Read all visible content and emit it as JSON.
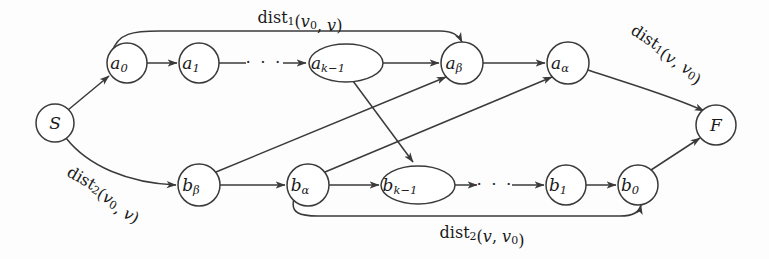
{
  "figure": {
    "background_color": "#fdfdfd",
    "stroke_color": "#3a3a3a",
    "text_color": "#1a1a1a",
    "width": 769,
    "height": 259
  },
  "nodes": [
    {
      "id": "S",
      "label_base": "S",
      "label_sub": "",
      "shape": "circle",
      "cx": 55,
      "cy": 123,
      "r": 19
    },
    {
      "id": "a0",
      "label_base": "a",
      "label_sub": "0",
      "shape": "circle",
      "cx": 127,
      "cy": 63,
      "r": 20
    },
    {
      "id": "a1",
      "label_base": "a",
      "label_sub": "1",
      "shape": "circle",
      "cx": 199,
      "cy": 63,
      "r": 20
    },
    {
      "id": "ak1",
      "label_base": "a",
      "label_sub": "k−1",
      "shape": "ellipse",
      "cx": 346,
      "cy": 63,
      "rx": 37,
      "ry": 19
    },
    {
      "id": "ab",
      "label_base": "a",
      "label_sub": "β",
      "shape": "circle",
      "cx": 462,
      "cy": 63,
      "r": 21
    },
    {
      "id": "aa",
      "label_base": "a",
      "label_sub": "α",
      "shape": "circle",
      "cx": 568,
      "cy": 63,
      "r": 21
    },
    {
      "id": "F",
      "label_base": "F",
      "label_sub": "",
      "shape": "circle",
      "cx": 716,
      "cy": 125,
      "r": 20
    },
    {
      "id": "bb",
      "label_base": "b",
      "label_sub": "β",
      "shape": "circle",
      "cx": 199,
      "cy": 185,
      "r": 21
    },
    {
      "id": "ba",
      "label_base": "b",
      "label_sub": "α",
      "shape": "circle",
      "cx": 308,
      "cy": 185,
      "r": 21
    },
    {
      "id": "bk1",
      "label_base": "b",
      "label_sub": "k−1",
      "shape": "ellipse",
      "cx": 418,
      "cy": 185,
      "rx": 37,
      "ry": 19
    },
    {
      "id": "b1",
      "label_base": "b",
      "label_sub": "1",
      "shape": "circle",
      "cx": 566,
      "cy": 185,
      "r": 20
    },
    {
      "id": "b0",
      "label_base": "b",
      "label_sub": "0",
      "shape": "circle",
      "cx": 638,
      "cy": 185,
      "r": 20
    }
  ],
  "ellipsis": [
    {
      "id": "top-ellipsis",
      "text": "· · ·",
      "x": 264,
      "y": 63
    },
    {
      "id": "bottom-ellipsis",
      "text": "· · ·",
      "x": 495,
      "y": 185
    }
  ],
  "edges": [
    {
      "id": "S-a0",
      "from": "S",
      "to": "a0",
      "d": "M 68 110 L 109 76",
      "arrow": true
    },
    {
      "id": "a0-a1",
      "from": "a0",
      "to": "a1",
      "d": "M 147 63 L 177 63",
      "arrow": true
    },
    {
      "id": "a1-dots",
      "from": "a1",
      "to": "dots",
      "d": "M 219 63 L 246 63",
      "arrow": false
    },
    {
      "id": "dots-ak1",
      "from": "dots",
      "to": "ak1",
      "d": "M 283 63 L 306 63",
      "arrow": true
    },
    {
      "id": "ak1-ab",
      "from": "ak1",
      "to": "ab",
      "d": "M 383 63 L 439 63",
      "arrow": true
    },
    {
      "id": "ab-aa",
      "from": "ab",
      "to": "aa",
      "d": "M 483 63 L 545 63",
      "arrow": true
    },
    {
      "id": "a0-ab-top",
      "from": "a0",
      "to": "ab",
      "d": "M 112 52 C 118 33 133 31 160 31 L 440 31 C 456 31 460 38 462 42",
      "arrow": true
    },
    {
      "id": "aa-F",
      "from": "aa",
      "to": "F",
      "d": "M 588 70 C 630 84 672 96 704 111",
      "arrow": true
    },
    {
      "id": "S-bb",
      "from": "S",
      "to": "bb",
      "d": "M 66 138 C 88 166 128 183 176 185",
      "arrow": true
    },
    {
      "id": "bb-ba",
      "from": "bb",
      "to": "ba",
      "d": "M 220 185 L 285 185",
      "arrow": true
    },
    {
      "id": "ba-bk1",
      "from": "ba",
      "to": "bk1",
      "d": "M 329 185 L 379 185",
      "arrow": true
    },
    {
      "id": "bk1-dots",
      "from": "bk1",
      "to": "dots",
      "d": "M 455 185 L 477 185",
      "arrow": true
    },
    {
      "id": "dots-b1",
      "from": "dots",
      "to": "b1",
      "d": "M 512 185 L 544 185",
      "arrow": true
    },
    {
      "id": "b1-b0",
      "from": "b1",
      "to": "b0",
      "d": "M 586 185 L 616 185",
      "arrow": true
    },
    {
      "id": "b0-F",
      "from": "b0",
      "to": "F",
      "d": "M 651 170 L 700 138",
      "arrow": true
    },
    {
      "id": "ba-b0-bot",
      "from": "ba",
      "to": "b0",
      "d": "M 294 199 C 290 213 300 216 318 216 L 620 216 C 636 216 640 210 641 205",
      "arrow": true
    },
    {
      "id": "ak1-bk1",
      "from": "ak1",
      "to": "bk1",
      "d": "M 353 81 L 413 162",
      "arrow": true
    },
    {
      "id": "bb-ab",
      "from": "bb",
      "to": "ab",
      "d": "M 216 172 L 446 77",
      "arrow": true
    },
    {
      "id": "ba-aa",
      "from": "ba",
      "to": "aa",
      "d": "M 325 172 L 552 77",
      "arrow": true
    }
  ],
  "edge_labels": [
    {
      "id": "dist1-v0-v",
      "parts": [
        {
          "t": "dist",
          "style": "up"
        },
        {
          "t": "1",
          "style": "sub"
        },
        {
          "t": "(",
          "style": "up"
        },
        {
          "t": "v",
          "style": "it"
        },
        {
          "t": "0",
          "style": "sub"
        },
        {
          "t": ", ",
          "style": "up"
        },
        {
          "t": "v",
          "style": "it"
        },
        {
          "t": ")",
          "style": "up"
        }
      ],
      "plain": "dist1(v0, v)",
      "x": 300,
      "y": 18,
      "rotate": 0
    },
    {
      "id": "dist1-v-v0",
      "parts": [
        {
          "t": "dist",
          "style": "up"
        },
        {
          "t": "1",
          "style": "sub"
        },
        {
          "t": "(",
          "style": "up"
        },
        {
          "t": "v",
          "style": "it"
        },
        {
          "t": ", ",
          "style": "up"
        },
        {
          "t": "v",
          "style": "it"
        },
        {
          "t": "0",
          "style": "sub"
        },
        {
          "t": ")",
          "style": "up"
        }
      ],
      "plain": "dist1(v, v0)",
      "x": 668,
      "y": 52,
      "rotate": 33
    },
    {
      "id": "dist2-v0-v",
      "parts": [
        {
          "t": "dist",
          "style": "up"
        },
        {
          "t": "2",
          "style": "sub"
        },
        {
          "t": "(",
          "style": "up"
        },
        {
          "t": "v",
          "style": "it"
        },
        {
          "t": "0",
          "style": "sub"
        },
        {
          "t": ", ",
          "style": "up"
        },
        {
          "t": "v",
          "style": "it"
        },
        {
          "t": ")",
          "style": "up"
        }
      ],
      "plain": "dist2(v0, v)",
      "x": 105,
      "y": 192,
      "rotate": 30
    },
    {
      "id": "dist2-v-v0",
      "parts": [
        {
          "t": "dist",
          "style": "up"
        },
        {
          "t": "2",
          "style": "sub"
        },
        {
          "t": "(",
          "style": "up"
        },
        {
          "t": "v",
          "style": "it"
        },
        {
          "t": ", ",
          "style": "up"
        },
        {
          "t": "v",
          "style": "it"
        },
        {
          "t": "0",
          "style": "sub"
        },
        {
          "t": ")",
          "style": "up"
        }
      ],
      "plain": "dist2(v, v0)",
      "x": 482,
      "y": 233,
      "rotate": 0
    }
  ]
}
